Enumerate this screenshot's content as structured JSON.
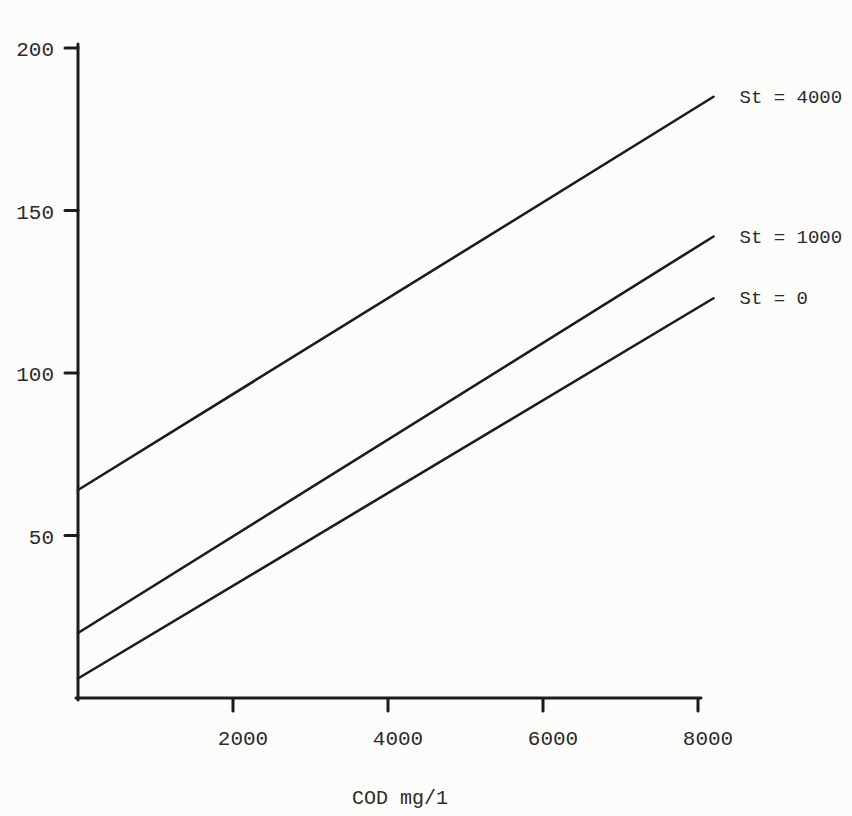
{
  "figure": {
    "background": "#fcfcfa",
    "ink_color": "#1c1c1c",
    "text_color": "#2b2b2b"
  },
  "chart_data": {
    "type": "line",
    "title": "",
    "xlabel": "COD mg/1",
    "ylabel": "",
    "xlim": [
      0,
      8200
    ],
    "ylim": [
      0,
      200
    ],
    "xticks": [
      2000,
      4000,
      6000,
      8000
    ],
    "yticks": [
      50,
      100,
      150,
      200
    ],
    "grid": false,
    "legend_position": "labels-at-line-ends-right",
    "series": [
      {
        "label": "St = 4000",
        "points": [
          [
            0,
            64
          ],
          [
            8200,
            185
          ]
        ]
      },
      {
        "label": "St = 1000",
        "points": [
          [
            0,
            20
          ],
          [
            8200,
            142
          ]
        ]
      },
      {
        "label": "St = 0",
        "points": [
          [
            0,
            6
          ],
          [
            8200,
            123
          ]
        ]
      }
    ]
  }
}
